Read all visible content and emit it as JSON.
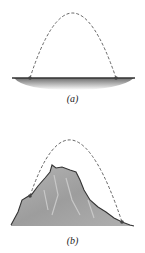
{
  "figures": [
    {
      "id": "a",
      "label": "(a)",
      "description": "Projectile trajectory over flat ground"
    },
    {
      "id": "b",
      "label": "(b)",
      "description": "Projectile trajectory over a hill"
    }
  ],
  "colors": {
    "trajectory": "#555555",
    "ground_line": "#333333",
    "ground_shade": "#9a9a9a",
    "hill_fill": "#a8a8a8",
    "point": "#444444"
  }
}
